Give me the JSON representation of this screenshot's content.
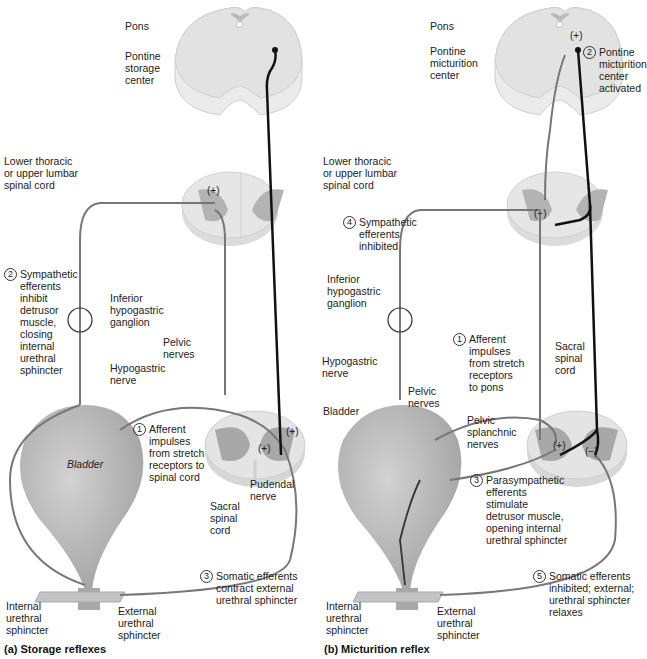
{
  "panels": [
    {
      "id": "a",
      "caption": "(a) Storage reflexes",
      "labels": {
        "pons": "Pons",
        "pontine_center": "Pontine\nstorage\ncenter",
        "lower_thoracic": "Lower thoracic\nor upper lumbar\nspinal cord",
        "inferior_ganglion": "Inferior\nhypogastric\nganglion",
        "pelvic_nerves": "Pelvic\nnerves",
        "hypogastric_nerve": "Hypogastric\nnerve",
        "bladder": "Bladder",
        "sacral_cord": "Sacral\nspinal\ncord",
        "pudendal_nerve": "Pudendal\nnerve",
        "internal_sphincter": "Internal\nurethral\nsphincter",
        "external_sphincter": "External\nurethral\nsphincter"
      },
      "steps": [
        {
          "n": "1",
          "text": "Afferent\nimpulses\nfrom stretch\nreceptors to\nspinal cord"
        },
        {
          "n": "2",
          "text": "Sympathetic\nefferents\ninhibit\ndetrusor\nmuscle,\nclosing\ninternal\nurethral\nsphincter"
        },
        {
          "n": "3",
          "text": "Somatic efferents\ncontract external\nurethral sphincter"
        }
      ],
      "signs": [
        "(+)",
        "(+)",
        "(+)"
      ]
    },
    {
      "id": "b",
      "caption": "(b) Micturition reflex",
      "labels": {
        "pons": "Pons",
        "pontine_center": "Pontine\nmicturition\ncenter",
        "lower_thoracic": "Lower thoracic\nor upper lumbar\nspinal cord",
        "inferior_ganglion": "Inferior\nhypogastric\nganglion",
        "hypogastric_nerve": "Hypogastric\nnerve",
        "pelvic_nerves": "Pelvic\nnerves",
        "pelvic_splanchnic": "Pelvic\nsplanchnic\nnerves",
        "bladder": "Bladder",
        "sacral_cord": "Sacral\nspinal\ncord",
        "internal_sphincter": "Internal\nurethral\nsphincter",
        "external_sphincter": "External\nurethral\nsphincter"
      },
      "steps": [
        {
          "n": "1",
          "text": "Afferent\nimpulses\nfrom stretch\nreceptors\nto pons"
        },
        {
          "n": "2",
          "text": "Pontine\nmicturition\ncenter\nactivated"
        },
        {
          "n": "3",
          "text": "Parasympathetic\nefferents\nstimulate\ndetrusor muscle,\nopening internal\nurethral sphincter"
        },
        {
          "n": "4",
          "text": "Sympathetic\nefferents\ninhibited"
        },
        {
          "n": "5",
          "text": "Somatic efferents\ninhibited; external;\nurethral sphincter\nrelaxes"
        }
      ],
      "signs": [
        "(+)",
        "(−)",
        "(+)",
        "(−)"
      ]
    }
  ],
  "colors": {
    "tissue": "#e4e4e4",
    "tissue_edge": "#c8c8c8",
    "gray_matter": "#a9a9a9",
    "bladder": "#b4b4b4",
    "afferent_nerve": "#777777",
    "descending_pathway": "#111111"
  }
}
